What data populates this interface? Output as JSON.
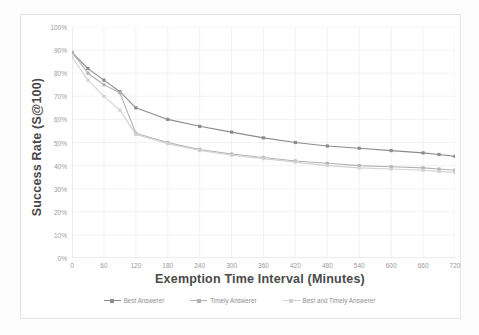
{
  "chart_data": {
    "type": "line",
    "title": "",
    "xlabel": "Exemption Time Interval (Minutes)",
    "ylabel": "Success Rate (S@100)",
    "xlim": [
      0,
      720
    ],
    "ylim": [
      0,
      1.0
    ],
    "grid": true,
    "legend_position": "bottom",
    "x": [
      0,
      30,
      60,
      90,
      120,
      180,
      240,
      300,
      360,
      420,
      480,
      540,
      600,
      660,
      690,
      720
    ],
    "xtick_labels": [
      "0",
      "60",
      "120",
      "180",
      "240",
      "300",
      "360",
      "420",
      "480",
      "540",
      "600",
      "660",
      "720"
    ],
    "xticks": [
      0,
      60,
      120,
      180,
      240,
      300,
      360,
      420,
      480,
      540,
      600,
      660,
      720
    ],
    "ytick_labels": [
      "0%",
      "10%",
      "20%",
      "30%",
      "40%",
      "50%",
      "60%",
      "70%",
      "80%",
      "90%",
      "100%"
    ],
    "yticks": [
      0,
      0.1,
      0.2,
      0.3,
      0.4,
      0.5,
      0.6,
      0.7,
      0.8,
      0.9,
      1.0
    ],
    "series": [
      {
        "name": "Best Answerer",
        "color": "#8c8c8c",
        "marker": "square",
        "values": [
          0.89,
          0.82,
          0.77,
          0.72,
          0.65,
          0.6,
          0.57,
          0.545,
          0.52,
          0.5,
          0.485,
          0.475,
          0.465,
          0.455,
          0.448,
          0.44
        ]
      },
      {
        "name": "Timely Answerer",
        "color": "#b3b3b3",
        "marker": "square",
        "values": [
          0.89,
          0.8,
          0.75,
          0.715,
          0.54,
          0.5,
          0.47,
          0.45,
          0.435,
          0.42,
          0.41,
          0.4,
          0.395,
          0.39,
          0.385,
          0.38
        ]
      },
      {
        "name": "Best and Timely Answerer",
        "color": "#d2d2d2",
        "marker": "square",
        "values": [
          0.87,
          0.77,
          0.7,
          0.64,
          0.535,
          0.495,
          0.465,
          0.445,
          0.43,
          0.415,
          0.4,
          0.39,
          0.385,
          0.38,
          0.375,
          0.37
        ]
      }
    ]
  },
  "legend": {
    "items": [
      {
        "label": "Best Answerer"
      },
      {
        "label": "Timely Answerer"
      },
      {
        "label": "Best and Timely Answerer"
      }
    ]
  }
}
